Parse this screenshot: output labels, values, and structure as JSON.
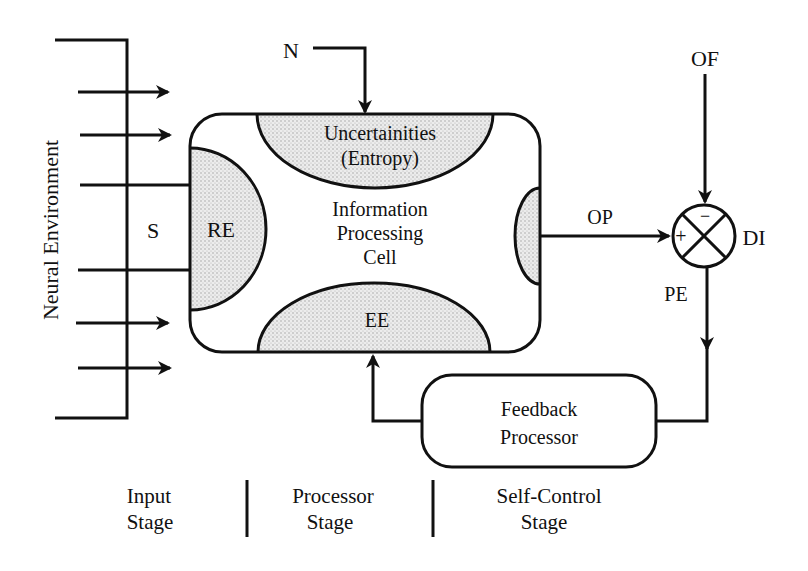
{
  "diagram": {
    "neural_environment_label": "Neural Environment",
    "signal_label": "S",
    "noise_label": "N",
    "cell": {
      "title_line1": "Information",
      "title_line2": "Processing",
      "title_line3": "Cell",
      "uncertainty_line1": "Uncertainities",
      "uncertainty_line2": "(Entropy)",
      "receptor_label": "RE",
      "effector_label": "EE"
    },
    "output_label": "OP",
    "objective_label": "OF",
    "comparator": {
      "label": "DI",
      "plus": "+",
      "minus": "−"
    },
    "error_label": "PE",
    "feedback": {
      "line1": "Feedback",
      "line2": "Processor"
    },
    "stages": [
      {
        "line1": "Input",
        "line2": "Stage"
      },
      {
        "line1": "Processor",
        "line2": "Stage"
      },
      {
        "line1": "Self-Control",
        "line2": "Stage"
      }
    ],
    "colors": {
      "ink": "#111111",
      "shade": "#d9d9d9",
      "background": "#ffffff"
    }
  }
}
